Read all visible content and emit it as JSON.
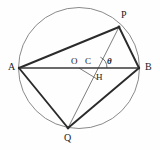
{
  "figure": {
    "colors": {
      "circle_stroke": "#8a8a8a",
      "chord_thick": "#2b2b2b",
      "line_thin": "#6f6f6f",
      "label": "#1a1a1a",
      "background": "#fefefe"
    },
    "circle": {
      "cx": 79,
      "cy": 68,
      "r": 60.5
    },
    "points": [
      {
        "name": "A",
        "label": "A",
        "x": 19,
        "y": 68,
        "lx": 8,
        "ly": 63
      },
      {
        "name": "B",
        "label": "B",
        "x": 139,
        "y": 68,
        "lx": 145,
        "ly": 63
      },
      {
        "name": "P",
        "label": "P",
        "x": 119,
        "y": 27,
        "lx": 121,
        "ly": 11
      },
      {
        "name": "Q",
        "label": "Q",
        "x": 68,
        "y": 128,
        "lx": 64,
        "ly": 133
      },
      {
        "name": "O",
        "label": "O",
        "x": 79,
        "y": 68,
        "lx": 72,
        "ly": 57
      },
      {
        "name": "C",
        "label": "C",
        "x": 95,
        "y": 68,
        "lx": 86,
        "ly": 57
      },
      {
        "name": "H",
        "label": "H",
        "x": 96,
        "y": 78,
        "lx": 97,
        "ly": 73
      }
    ],
    "angle": {
      "label": "θ",
      "at": "C",
      "lx": 107,
      "ly": 57,
      "vertex_x": 95,
      "vertex_y": 68
    },
    "thick_segments": [
      {
        "name": "AP",
        "x1": 19,
        "y1": 68,
        "x2": 119,
        "y2": 27
      },
      {
        "name": "PB",
        "x1": 119,
        "y1": 27,
        "x2": 139,
        "y2": 68
      },
      {
        "name": "AQ",
        "x1": 19,
        "y1": 68,
        "x2": 68,
        "y2": 128
      },
      {
        "name": "QB",
        "x1": 68,
        "y1": 128,
        "x2": 139,
        "y2": 68
      },
      {
        "name": "AB",
        "x1": 19,
        "y1": 68,
        "x2": 139,
        "y2": 68
      }
    ],
    "thin_segments": [
      {
        "name": "PQ",
        "x1": 119,
        "y1": 27,
        "x2": 68,
        "y2": 128
      },
      {
        "name": "OH",
        "x1": 79,
        "y1": 68,
        "x2": 97,
        "y2": 79
      },
      {
        "name": "QC-extension",
        "x1": 68,
        "y1": 128,
        "x2": 119,
        "y2": 27
      }
    ]
  }
}
